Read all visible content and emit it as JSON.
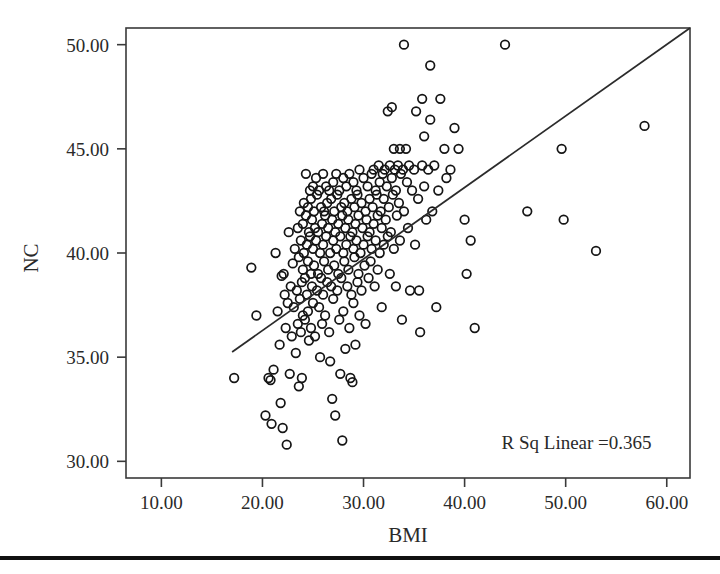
{
  "chart_data": {
    "type": "scatter",
    "title": "",
    "xlabel": "BMI",
    "ylabel": "NC",
    "xlim": [
      6.5,
      62.3
    ],
    "ylim": [
      29.2,
      50.8
    ],
    "xticks": [
      10,
      20,
      30,
      40,
      50,
      60
    ],
    "xtick_labels": [
      "10.00",
      "20.00",
      "30.00",
      "40.00",
      "50.00",
      "60.00"
    ],
    "yticks": [
      30,
      35,
      40,
      45,
      50
    ],
    "ytick_labels": [
      "30.00",
      "35.00",
      "40.00",
      "45.00",
      "50.00"
    ],
    "grid": false,
    "legend": null,
    "marker_style": "open-circle",
    "annotations": [
      {
        "text": "R Sq Linear =0.365",
        "x": 58.5,
        "y": 30.6,
        "align": "right",
        "r_squared": 0.365
      }
    ],
    "fit_line": {
      "type": "linear",
      "x_start": 17.0,
      "y_start": 35.25,
      "x_end": 62.3,
      "y_end": 50.8,
      "slope": 0.3434,
      "intercept": 29.41
    },
    "points": [
      [
        17.2,
        34.0
      ],
      [
        18.9,
        39.3
      ],
      [
        19.4,
        37.0
      ],
      [
        20.3,
        32.2
      ],
      [
        20.6,
        34.0
      ],
      [
        20.8,
        33.9
      ],
      [
        20.9,
        31.8
      ],
      [
        21.1,
        34.4
      ],
      [
        21.3,
        40.0
      ],
      [
        21.5,
        37.2
      ],
      [
        21.7,
        35.6
      ],
      [
        21.8,
        32.8
      ],
      [
        21.9,
        38.9
      ],
      [
        22.0,
        31.6
      ],
      [
        22.1,
        39.0
      ],
      [
        22.2,
        38.0
      ],
      [
        22.3,
        36.4
      ],
      [
        22.4,
        30.8
      ],
      [
        22.5,
        37.6
      ],
      [
        22.6,
        41.0
      ],
      [
        22.7,
        34.2
      ],
      [
        22.8,
        38.4
      ],
      [
        22.9,
        36.0
      ],
      [
        23.0,
        39.5
      ],
      [
        23.1,
        37.4
      ],
      [
        23.2,
        40.2
      ],
      [
        23.3,
        35.2
      ],
      [
        23.4,
        38.2
      ],
      [
        23.5,
        41.2
      ],
      [
        23.5,
        36.6
      ],
      [
        23.6,
        39.8
      ],
      [
        23.6,
        33.6
      ],
      [
        23.7,
        42.0
      ],
      [
        23.7,
        37.8
      ],
      [
        23.8,
        40.6
      ],
      [
        23.8,
        36.2
      ],
      [
        23.9,
        38.6
      ],
      [
        23.9,
        34.0
      ],
      [
        24.0,
        41.4
      ],
      [
        24.0,
        39.2
      ],
      [
        24.0,
        37.0
      ],
      [
        24.1,
        42.4
      ],
      [
        24.1,
        40.0
      ],
      [
        24.2,
        38.8
      ],
      [
        24.2,
        36.8
      ],
      [
        24.3,
        43.8
      ],
      [
        24.3,
        41.8
      ],
      [
        24.4,
        40.4
      ],
      [
        24.4,
        38.0
      ],
      [
        24.5,
        42.2
      ],
      [
        24.5,
        39.6
      ],
      [
        24.5,
        37.2
      ],
      [
        24.6,
        41.0
      ],
      [
        24.6,
        35.8
      ],
      [
        24.7,
        43.0
      ],
      [
        24.7,
        40.8
      ],
      [
        24.8,
        42.6
      ],
      [
        24.8,
        39.0
      ],
      [
        24.8,
        36.4
      ],
      [
        24.9,
        41.6
      ],
      [
        24.9,
        38.4
      ],
      [
        25.0,
        43.2
      ],
      [
        25.0,
        40.2
      ],
      [
        25.0,
        37.6
      ],
      [
        25.1,
        42.0
      ],
      [
        25.1,
        39.4
      ],
      [
        25.2,
        41.2
      ],
      [
        25.2,
        36.0
      ],
      [
        25.3,
        43.6
      ],
      [
        25.3,
        40.6
      ],
      [
        25.4,
        38.2
      ],
      [
        25.4,
        42.8
      ],
      [
        25.5,
        41.0
      ],
      [
        25.5,
        39.0
      ],
      [
        25.6,
        37.4
      ],
      [
        25.6,
        43.0
      ],
      [
        25.7,
        40.0
      ],
      [
        25.7,
        35.0
      ],
      [
        25.8,
        42.2
      ],
      [
        25.8,
        38.8
      ],
      [
        25.9,
        41.4
      ],
      [
        25.9,
        36.6
      ],
      [
        26.0,
        43.8
      ],
      [
        26.0,
        40.4
      ],
      [
        26.0,
        38.0
      ],
      [
        26.1,
        42.0
      ],
      [
        26.1,
        39.6
      ],
      [
        26.2,
        41.8
      ],
      [
        26.2,
        37.0
      ],
      [
        26.3,
        43.2
      ],
      [
        26.3,
        40.8
      ],
      [
        26.4,
        38.6
      ],
      [
        26.4,
        42.4
      ],
      [
        26.5,
        41.2
      ],
      [
        26.5,
        39.2
      ],
      [
        26.6,
        36.2
      ],
      [
        26.6,
        43.0
      ],
      [
        26.7,
        40.0
      ],
      [
        26.7,
        34.8
      ],
      [
        26.8,
        42.6
      ],
      [
        26.8,
        38.4
      ],
      [
        26.9,
        41.6
      ],
      [
        26.9,
        33.0
      ],
      [
        27.0,
        43.4
      ],
      [
        27.0,
        40.6
      ],
      [
        27.0,
        37.8
      ],
      [
        27.1,
        42.0
      ],
      [
        27.1,
        39.4
      ],
      [
        27.2,
        41.0
      ],
      [
        27.2,
        32.2
      ],
      [
        27.3,
        43.8
      ],
      [
        27.3,
        40.2
      ],
      [
        27.4,
        38.2
      ],
      [
        27.4,
        42.8
      ],
      [
        27.5,
        41.4
      ],
      [
        27.5,
        39.0
      ],
      [
        27.6,
        36.8
      ],
      [
        27.6,
        43.0
      ],
      [
        27.7,
        40.8
      ],
      [
        27.7,
        34.2
      ],
      [
        27.8,
        42.2
      ],
      [
        27.8,
        38.8
      ],
      [
        27.9,
        41.8
      ],
      [
        27.9,
        31.0
      ],
      [
        28.0,
        43.6
      ],
      [
        28.0,
        40.0
      ],
      [
        28.0,
        37.2
      ],
      [
        28.1,
        42.4
      ],
      [
        28.1,
        39.6
      ],
      [
        28.2,
        41.2
      ],
      [
        28.2,
        35.4
      ],
      [
        28.3,
        43.2
      ],
      [
        28.3,
        40.4
      ],
      [
        28.4,
        38.4
      ],
      [
        28.4,
        42.0
      ],
      [
        28.5,
        41.6
      ],
      [
        28.5,
        39.2
      ],
      [
        28.6,
        36.4
      ],
      [
        28.6,
        43.8
      ],
      [
        28.7,
        40.8
      ],
      [
        28.7,
        34.0
      ],
      [
        28.8,
        42.6
      ],
      [
        28.8,
        38.0
      ],
      [
        28.9,
        41.0
      ],
      [
        28.9,
        33.8
      ],
      [
        29.0,
        43.4
      ],
      [
        29.0,
        40.2
      ],
      [
        29.0,
        37.6
      ],
      [
        29.1,
        42.2
      ],
      [
        29.1,
        39.8
      ],
      [
        29.2,
        41.4
      ],
      [
        29.2,
        35.6
      ],
      [
        29.3,
        43.0
      ],
      [
        29.3,
        40.6
      ],
      [
        29.4,
        38.6
      ],
      [
        29.4,
        42.8
      ],
      [
        29.5,
        41.8
      ],
      [
        29.5,
        39.0
      ],
      [
        29.6,
        37.0
      ],
      [
        29.6,
        44.0
      ],
      [
        29.7,
        40.0
      ],
      [
        29.8,
        42.4
      ],
      [
        29.8,
        38.2
      ],
      [
        29.9,
        41.2
      ],
      [
        30.0,
        43.6
      ],
      [
        30.0,
        40.4
      ],
      [
        30.1,
        39.4
      ],
      [
        30.2,
        42.0
      ],
      [
        30.2,
        36.6
      ],
      [
        30.3,
        41.6
      ],
      [
        30.4,
        43.2
      ],
      [
        30.4,
        40.8
      ],
      [
        30.5,
        38.8
      ],
      [
        30.6,
        42.6
      ],
      [
        30.6,
        41.0
      ],
      [
        30.7,
        39.6
      ],
      [
        30.8,
        43.8
      ],
      [
        30.8,
        40.2
      ],
      [
        30.9,
        42.2
      ],
      [
        31.0,
        44.0
      ],
      [
        31.0,
        41.4
      ],
      [
        31.1,
        38.4
      ],
      [
        31.2,
        43.0
      ],
      [
        31.2,
        40.6
      ],
      [
        31.3,
        42.8
      ],
      [
        31.4,
        41.8
      ],
      [
        31.4,
        39.2
      ],
      [
        31.5,
        44.2
      ],
      [
        31.6,
        40.0
      ],
      [
        31.6,
        43.4
      ],
      [
        31.7,
        42.0
      ],
      [
        31.8,
        41.2
      ],
      [
        31.8,
        37.4
      ],
      [
        31.9,
        43.8
      ],
      [
        32.0,
        40.4
      ],
      [
        32.0,
        42.6
      ],
      [
        32.1,
        44.0
      ],
      [
        32.2,
        41.6
      ],
      [
        32.3,
        43.2
      ],
      [
        32.4,
        40.8
      ],
      [
        32.4,
        46.8
      ],
      [
        32.5,
        42.2
      ],
      [
        32.6,
        44.2
      ],
      [
        32.6,
        39.0
      ],
      [
        32.7,
        41.0
      ],
      [
        32.8,
        43.6
      ],
      [
        32.8,
        47.0
      ],
      [
        32.9,
        42.8
      ],
      [
        33.0,
        45.0
      ],
      [
        33.0,
        40.2
      ],
      [
        33.1,
        44.0
      ],
      [
        33.2,
        43.0
      ],
      [
        33.2,
        38.4
      ],
      [
        33.3,
        41.8
      ],
      [
        33.4,
        44.2
      ],
      [
        33.5,
        42.4
      ],
      [
        33.6,
        45.0
      ],
      [
        33.6,
        40.6
      ],
      [
        33.7,
        43.8
      ],
      [
        33.8,
        36.8
      ],
      [
        33.9,
        44.0
      ],
      [
        34.0,
        50.0
      ],
      [
        34.0,
        42.0
      ],
      [
        34.2,
        45.0
      ],
      [
        34.3,
        43.4
      ],
      [
        34.4,
        41.2
      ],
      [
        34.5,
        44.2
      ],
      [
        34.6,
        38.2
      ],
      [
        34.8,
        43.0
      ],
      [
        35.0,
        44.0
      ],
      [
        35.1,
        40.4
      ],
      [
        35.2,
        46.8
      ],
      [
        35.4,
        42.6
      ],
      [
        35.5,
        38.2
      ],
      [
        35.6,
        36.2
      ],
      [
        35.8,
        44.2
      ],
      [
        35.8,
        47.4
      ],
      [
        36.0,
        45.6
      ],
      [
        36.0,
        43.2
      ],
      [
        36.2,
        41.6
      ],
      [
        36.4,
        44.0
      ],
      [
        36.6,
        49.0
      ],
      [
        36.6,
        46.4
      ],
      [
        36.8,
        42.0
      ],
      [
        37.0,
        44.2
      ],
      [
        37.2,
        37.4
      ],
      [
        37.4,
        43.0
      ],
      [
        37.6,
        47.4
      ],
      [
        38.0,
        45.0
      ],
      [
        38.2,
        43.6
      ],
      [
        38.6,
        44.0
      ],
      [
        39.0,
        46.0
      ],
      [
        39.4,
        45.0
      ],
      [
        40.0,
        41.6
      ],
      [
        40.2,
        39.0
      ],
      [
        40.6,
        40.6
      ],
      [
        41.0,
        36.4
      ],
      [
        44.0,
        50.0
      ],
      [
        46.2,
        42.0
      ],
      [
        49.6,
        45.0
      ],
      [
        49.8,
        41.6
      ],
      [
        53.0,
        40.1
      ],
      [
        57.8,
        46.1
      ]
    ]
  }
}
